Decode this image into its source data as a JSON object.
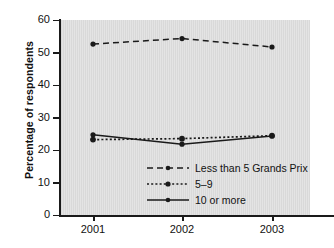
{
  "chart_data": {
    "type": "line",
    "title": "",
    "xlabel": "",
    "ylabel": "Percentage of respondents",
    "categories": [
      "2001",
      "2002",
      "2003"
    ],
    "x": [
      2001,
      2002,
      2003
    ],
    "ylim": [
      0,
      60
    ],
    "yticks": [
      0,
      10,
      20,
      30,
      40,
      50,
      60
    ],
    "ytick_labels": [
      "0",
      "10",
      "20",
      "30",
      "40",
      "50",
      "60"
    ],
    "xtick_labels": [
      "2001",
      "2002",
      "2003"
    ],
    "grid": false,
    "legend_position": "inside-lower-center",
    "plot_background": "#d9d9d9",
    "line_color": "#1a1a1a",
    "series": [
      {
        "name": "Less than 5 Grands Prix",
        "style": "dashed",
        "marker": "circle",
        "values": [
          52.6,
          54.3,
          51.7
        ]
      },
      {
        "name": "5–9",
        "style": "dotted",
        "marker": "circle",
        "values": [
          23.2,
          23.5,
          24.4
        ]
      },
      {
        "name": "10 or more",
        "style": "solid",
        "marker": "circle",
        "values": [
          24.7,
          21.8,
          24.3
        ]
      }
    ]
  },
  "axis": {
    "y_title": "Percentage of respondents",
    "y_ticks": [
      "60",
      "50",
      "40",
      "30",
      "20",
      "10",
      "0"
    ],
    "x_ticks": [
      "2001",
      "2002",
      "2003"
    ]
  },
  "legend": {
    "items": [
      {
        "label": "Less than 5 Grands Prix",
        "style": "dashed"
      },
      {
        "label": "5–9",
        "style": "dotted"
      },
      {
        "label": "10 or more",
        "style": "solid"
      }
    ]
  }
}
